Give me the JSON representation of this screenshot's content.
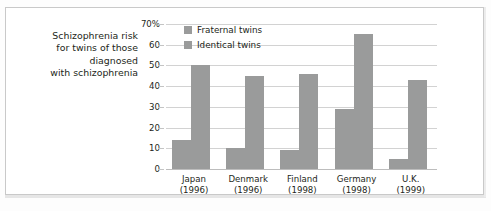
{
  "caption": {
    "lines": [
      "Schizophrenia risk",
      "for twins of those",
      "diagnosed",
      "with schizophrenia"
    ]
  },
  "chart_data": {
    "type": "bar",
    "title": "Schizophrenia risk for twins of those diagnosed with schizophrenia",
    "xlabel": "",
    "ylabel": "",
    "ylim": [
      0,
      70
    ],
    "grid": true,
    "legend_position": "top-left-inside",
    "categories": [
      "Japan",
      "Denmark",
      "Finland",
      "Germany",
      "U.K."
    ],
    "category_years": [
      "(1996)",
      "(1996)",
      "(1998)",
      "(1998)",
      "(1999)"
    ],
    "tick_labels": [
      "70%",
      "60",
      "50",
      "40",
      "30",
      "20",
      "10",
      "0"
    ],
    "tick_values": [
      70,
      60,
      50,
      40,
      30,
      20,
      10,
      0
    ],
    "series": [
      {
        "name": "Fraternal twins",
        "color": "#9a9b9b",
        "values": [
          14,
          10,
          9,
          29,
          5
        ]
      },
      {
        "name": "Identical twins",
        "color": "#9a9b9b",
        "values": [
          50,
          45,
          46,
          65,
          43
        ]
      }
    ]
  },
  "colors": {
    "bar": "#9a9b9b",
    "grid": "#d2d2d2",
    "text": "#231f20",
    "frame": "#c9c9c9"
  }
}
